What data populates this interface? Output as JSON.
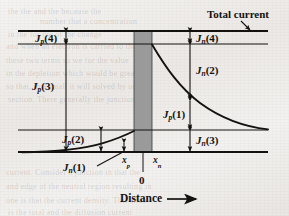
{
  "figure": {
    "kind": "pn-junction-current-components-diagram",
    "background_color": "#efece9",
    "ink_color": "#141210",
    "junction_fill_color": "#9a9a9a",
    "title_annotation": "Total current",
    "axis": {
      "x_label": "Distance",
      "x_arrow": "right-arrow",
      "origin_label": "0",
      "tick_left_label": "x",
      "tick_left_sub": "p",
      "tick_right_label": "x",
      "tick_right_sub": "n"
    },
    "labels": [
      {
        "id": "jp4",
        "symbol": "J",
        "sub": "p",
        "arg": "(4)"
      },
      {
        "id": "jp3",
        "symbol": "J",
        "sub": "p",
        "arg": "(3)"
      },
      {
        "id": "jp2",
        "symbol": "J",
        "sub": "p",
        "arg": "(2)"
      },
      {
        "id": "jn1",
        "symbol": "J",
        "sub": "n",
        "arg": "(1)"
      },
      {
        "id": "jn4",
        "symbol": "J",
        "sub": "n",
        "arg": "(4)"
      },
      {
        "id": "jn2",
        "symbol": "J",
        "sub": "n",
        "arg": "(2)"
      },
      {
        "id": "jp1",
        "symbol": "J",
        "sub": "p",
        "arg": "(1)"
      },
      {
        "id": "jn3",
        "symbol": "J",
        "sub": "n",
        "arg": "(3)"
      }
    ]
  },
  "chart_data": {
    "type": "line",
    "title": "Total current",
    "xlabel": "Distance",
    "ylabel": "",
    "grid": false,
    "legend": "none",
    "xlim": [
      0,
      289
    ],
    "ylim": [
      216,
      0
    ],
    "annotations": [
      {
        "text": "Total current",
        "x": 207,
        "y": 14
      },
      {
        "text": "Distance",
        "x": 122,
        "y": 199
      },
      {
        "text": "0",
        "x": 142,
        "y": 183
      },
      {
        "text": "x_p",
        "x": 122,
        "y": 163
      },
      {
        "text": "x_n",
        "x": 153,
        "y": 163
      }
    ],
    "horizontal_levels": [
      {
        "name": "total-current-line",
        "y": 31,
        "x_from": 18,
        "x_to": 268,
        "weight": "thick"
      },
      {
        "name": "upper-level-line",
        "y": 44,
        "x_from": 18,
        "x_to": 268,
        "weight": "thin"
      },
      {
        "name": "lower-level-line",
        "y": 130,
        "x_from": 18,
        "x_to": 268,
        "weight": "thin"
      },
      {
        "name": "baseline-zero-line",
        "y": 152,
        "x_from": 18,
        "x_to": 268,
        "weight": "thick"
      }
    ],
    "junction_band": {
      "x_from": 134,
      "x_to": 152,
      "y_from": 31,
      "y_to": 152
    },
    "series": [
      {
        "name": "hole-current-p-side",
        "note": "rising exponential on p-side from baseline to junction",
        "points": [
          [
            22,
            152.2
          ],
          [
            40,
            151.2
          ],
          [
            58,
            149.6
          ],
          [
            74,
            147.2
          ],
          [
            88,
            144.4
          ],
          [
            100,
            141.4
          ],
          [
            110,
            138.6
          ],
          [
            118,
            136.0
          ],
          [
            125,
            133.8
          ],
          [
            130,
            132.2
          ],
          [
            134,
            131.0
          ]
        ]
      },
      {
        "name": "electron-current-n-side",
        "note": "decaying exponential on n-side from upper level to lower level",
        "points": [
          [
            152,
            44.5
          ],
          [
            160,
            55
          ],
          [
            168,
            65
          ],
          [
            176,
            74
          ],
          [
            184,
            82
          ],
          [
            192,
            89.5
          ],
          [
            200,
            96.5
          ],
          [
            210,
            104
          ],
          [
            220,
            110.5
          ],
          [
            232,
            117
          ],
          [
            244,
            122.5
          ],
          [
            256,
            126.5
          ],
          [
            266,
            129
          ],
          [
            268,
            129.4
          ]
        ]
      }
    ],
    "dimension_arrows": [
      {
        "name": "jp4",
        "x": 66,
        "y_from": 31,
        "y_to": 44
      },
      {
        "name": "jp3",
        "x": 66,
        "y_from": 44,
        "y_to": 152
      },
      {
        "name": "jp2",
        "x": 101,
        "y_from": 130,
        "y_to": 152
      },
      {
        "name": "jn1",
        "x": 124,
        "y_from": 143,
        "y_to": 152
      },
      {
        "name": "jn4",
        "x": 190,
        "y_from": 31,
        "y_to": 44
      },
      {
        "name": "jn2",
        "x": 190,
        "y_from": 44,
        "y_to": 100
      },
      {
        "name": "jp1",
        "x": 190,
        "y_from": 100,
        "y_to": 130
      },
      {
        "name": "jn3",
        "x": 190,
        "y_from": 130,
        "y_to": 152
      }
    ]
  },
  "ghost_text": [
    {
      "t": "the the and the because the",
      "x": 8,
      "y": 7
    },
    {
      "t": "number that a concentration",
      "x": 40,
      "y": 17
    },
    {
      "t": "in the for the of the change",
      "x": 8,
      "y": 30
    },
    {
      "t": "and when an electron is carried to the",
      "x": 6,
      "y": 42
    },
    {
      "t": "these two terms so we for the value",
      "x": 6,
      "y": 56
    },
    {
      "t": "in the depletion which would be greater",
      "x": 6,
      "y": 69
    },
    {
      "t": "so that, in a small it will solved by one",
      "x": 6,
      "y": 82
    },
    {
      "t": "section. There generally the junction",
      "x": 8,
      "y": 95
    },
    {
      "t": "current. Consider a junction in that the",
      "x": 6,
      "y": 168
    },
    {
      "t": "and edge of the neutral region resulting in",
      "x": 6,
      "y": 182
    },
    {
      "t": "one is that the current density. This situa",
      "x": 6,
      "y": 196
    },
    {
      "t": "is the total and the diffusion current",
      "x": 8,
      "y": 208
    }
  ]
}
